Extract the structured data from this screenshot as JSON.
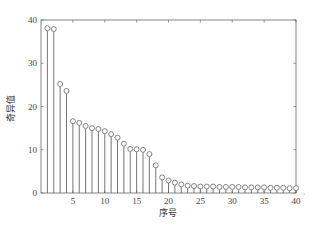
{
  "chart_data": {
    "type": "stem",
    "title": "",
    "xlabel": "序号",
    "ylabel": "奇异值",
    "xlim": [
      0,
      40
    ],
    "ylim": [
      0,
      40
    ],
    "xticks": [
      5,
      10,
      15,
      20,
      25,
      30,
      35,
      40
    ],
    "yticks": [
      0,
      10,
      20,
      30,
      40
    ],
    "grid": false,
    "legend": null,
    "x": [
      1,
      2,
      3,
      4,
      5,
      6,
      7,
      8,
      9,
      10,
      11,
      12,
      13,
      14,
      15,
      16,
      17,
      18,
      19,
      20,
      21,
      22,
      23,
      24,
      25,
      26,
      27,
      28,
      29,
      30,
      31,
      32,
      33,
      34,
      35,
      36,
      37,
      38,
      39,
      40
    ],
    "values": [
      38.1,
      37.9,
      25.2,
      23.6,
      16.6,
      16.2,
      15.5,
      15.0,
      14.8,
      14.3,
      13.6,
      12.8,
      11.4,
      10.2,
      10.1,
      10.0,
      9.0,
      6.4,
      3.6,
      2.9,
      2.4,
      2.0,
      1.7,
      1.6,
      1.5,
      1.5,
      1.5,
      1.4,
      1.4,
      1.4,
      1.4,
      1.3,
      1.3,
      1.3,
      1.3,
      1.2,
      1.2,
      1.2,
      1.1,
      1.1
    ],
    "marker": "circle-open",
    "line_color": "#666666"
  },
  "caption_partial": "",
  "axis": {
    "xlabel": "序号",
    "ylabel": "奇异值"
  }
}
